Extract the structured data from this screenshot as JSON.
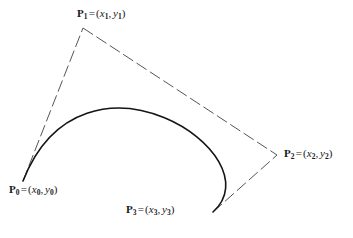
{
  "figure": {
    "type": "bezier-curve-with-control-polygon",
    "background_color": "#ffffff",
    "curve_color": "#141414",
    "polygon_color": "#555555",
    "text_color": "#1a1a1a",
    "caption": "",
    "labels": {
      "p0": {
        "point": "P",
        "index": "0",
        "equals": "=",
        "open": "(",
        "x": "x",
        "xsub": "0",
        "comma": ",",
        "y": "y",
        "ysub": "0",
        "close": ")",
        "full_text": "P0 = (x0, y0)"
      },
      "p1": {
        "point": "P",
        "index": "1",
        "equals": "=",
        "open": "(",
        "x": "x",
        "xsub": "1",
        "comma": ",",
        "y": "y",
        "ysub": "1",
        "close": ")",
        "full_text": "P1 = (x1, y1)"
      },
      "p2": {
        "point": "P",
        "index": "2",
        "equals": "=",
        "open": "(",
        "x": "x",
        "xsub": "2",
        "comma": ",",
        "y": "y",
        "ysub": "2",
        "close": ")",
        "full_text": "P2 = (x2, y2)"
      },
      "p3": {
        "point": "P",
        "index": "3",
        "equals": "=",
        "open": "(",
        "x": "x",
        "xsub": "3",
        "comma": ",",
        "y": "y",
        "ysub": "3",
        "close": ")",
        "full_text": "P3 = (x3, y3)"
      }
    }
  },
  "chart_data": {
    "type": "line",
    "title": "",
    "xlabel": "",
    "ylabel": "",
    "grid": false,
    "legend": "none",
    "xlim": [
      0,
      353
    ],
    "ylim": [
      238,
      0
    ],
    "control_points": [
      {
        "name": "P0",
        "x": 23,
        "y": 181
      },
      {
        "name": "P1",
        "x": 83,
        "y": 28
      },
      {
        "name": "P2",
        "x": 277,
        "y": 155
      },
      {
        "name": "P3",
        "x": 213,
        "y": 212
      }
    ],
    "curve_path": "M 23 181 C 83 28, 277 155, 213 212",
    "polygon_segments": [
      {
        "from": "P0",
        "to": "P1",
        "x1": 23,
        "y1": 181,
        "x2": 83,
        "y2": 28
      },
      {
        "from": "P1",
        "to": "P2",
        "x1": 83,
        "y1": 28,
        "x2": 277,
        "y2": 155
      },
      {
        "from": "P3",
        "to": "P2",
        "x1": 213,
        "y1": 212,
        "x2": 277,
        "y2": 155
      }
    ],
    "dash_pattern": "12 4",
    "curve_stroke_width": 1.6,
    "polygon_stroke_width": 1.0
  }
}
